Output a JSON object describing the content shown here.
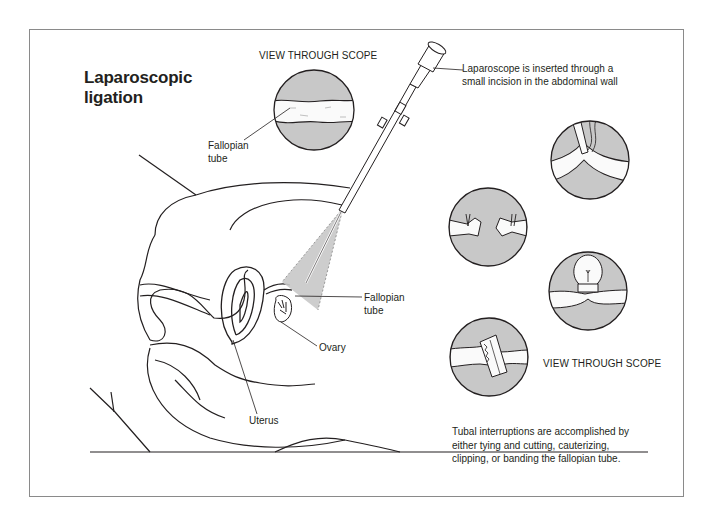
{
  "figure": {
    "title_lines": [
      "Laparoscopic",
      "ligation"
    ],
    "colors": {
      "ink": "#231f20",
      "scope_gray": "#c8c8c8",
      "frame_border": "#8a8a8a",
      "background": "#ffffff"
    }
  },
  "labels": {
    "view_through_scope_top": "VIEW THROUGH SCOPE",
    "view_through_scope_right": "VIEW THROUGH SCOPE",
    "fallopian_tube_top": [
      "Fallopian",
      "tube"
    ],
    "fallopian_tube_mid": [
      "Fallopian",
      "tube"
    ],
    "ovary": "Ovary",
    "uterus": "Uterus",
    "laparoscope_note": [
      "Laparoscope is inserted through a",
      "small incision in the abdominal wall"
    ],
    "tubal_note": [
      "Tubal interruptions are accomplished by",
      "either tying and cutting, cauterizing,",
      "clipping, or banding the fallopian tube."
    ]
  },
  "scope_views": [
    {
      "id": "overview",
      "depicts": "fallopian tube"
    },
    {
      "id": "cauterizing",
      "depicts": "cautery probe on tube"
    },
    {
      "id": "tying-cutting",
      "depicts": "tied and cut tube ends"
    },
    {
      "id": "banding",
      "depicts": "band around tube loop"
    },
    {
      "id": "clipping",
      "depicts": "clip across tube"
    }
  ]
}
